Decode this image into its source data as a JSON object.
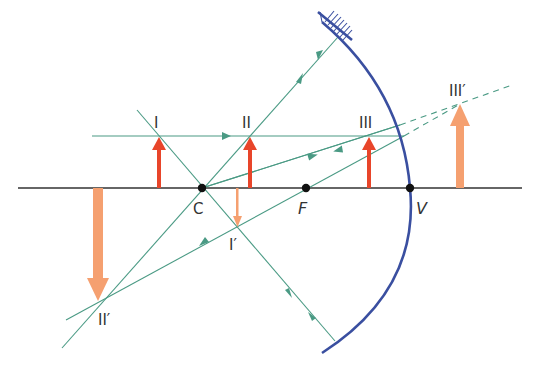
{
  "diagram": {
    "colors": {
      "axis": "#333333",
      "mirror": "#3a4fa0",
      "ray": "#4a9a84",
      "object": "#e8452a",
      "image": "#f5a070",
      "point": "#111111",
      "label": "#333333"
    },
    "points": [
      {
        "id": "C",
        "label": "C",
        "x": 202,
        "y": 188
      },
      {
        "id": "F",
        "label": "F",
        "x": 306,
        "y": 188
      },
      {
        "id": "V",
        "label": "V",
        "x": 410,
        "y": 188
      }
    ],
    "objects": [
      {
        "id": "I",
        "label": "I",
        "x": 159,
        "base_y": 188,
        "tip_y": 136
      },
      {
        "id": "II",
        "label": "II",
        "x": 250,
        "base_y": 188,
        "tip_y": 136
      },
      {
        "id": "III",
        "label": "III",
        "x": 369,
        "base_y": 188,
        "tip_y": 136
      }
    ],
    "images": [
      {
        "id": "I_prime",
        "label": "I′",
        "x": 237,
        "base_y": 188,
        "tip_y": 228,
        "orientation": "inverted",
        "size": "diminished"
      },
      {
        "id": "II_prime",
        "label": "II′",
        "x": 98,
        "base_y": 188,
        "tip_y": 302,
        "orientation": "inverted",
        "size": "magnified"
      },
      {
        "id": "III_prime",
        "label": "III′",
        "x": 460,
        "base_y": 188,
        "tip_y": 103,
        "orientation": "upright",
        "size": "magnified",
        "virtual": true
      }
    ],
    "labels": {
      "C": "C",
      "F": "F",
      "V": "V",
      "I": "I",
      "II": "II",
      "III": "III",
      "I_prime": "I′",
      "II_prime": "II′",
      "III_prime": "III′"
    }
  }
}
